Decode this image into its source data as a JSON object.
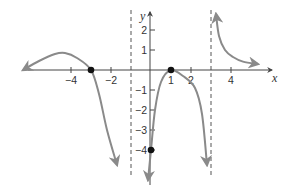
{
  "chart_data": {
    "type": "line",
    "title": "",
    "xlabel": "x",
    "ylabel": "y",
    "xlim": [
      -6.4,
      6.2
    ],
    "ylim": [
      -5.6,
      3.0
    ],
    "grid": false,
    "legend": null,
    "x_ticks": [
      -4,
      -2,
      1,
      2,
      4
    ],
    "x_tick_labels": [
      "−4",
      "−2",
      "1",
      "2",
      "4"
    ],
    "y_ticks": [
      2,
      1,
      -1,
      -2,
      -3,
      -4
    ],
    "y_tick_labels": [
      "2",
      "1",
      "−1",
      "−2",
      "−3",
      "−4"
    ],
    "vertical_asymptotes": [
      -1,
      3
    ],
    "marked_points": [
      {
        "x": -3,
        "y": 0,
        "label": "x-intercept"
      },
      {
        "x": 1,
        "y": 0,
        "label": "x-intercept"
      },
      {
        "x": 0,
        "y": -4,
        "label": "y-intercept"
      }
    ],
    "series": [
      {
        "name": "left-branch",
        "points": [
          [
            -6.4,
            0.0
          ],
          [
            -5.6,
            0.45
          ],
          [
            -4.8,
            0.8
          ],
          [
            -4.3,
            0.85
          ],
          [
            -3.7,
            0.6
          ],
          [
            -3.0,
            0.0
          ],
          [
            -2.6,
            -1.2
          ],
          [
            -2.2,
            -3.0
          ],
          [
            -1.7,
            -4.75
          ]
        ],
        "arrow_start": true,
        "arrow_end": true
      },
      {
        "name": "middle-branch",
        "points": [
          [
            -0.15,
            -5.5
          ],
          [
            0.0,
            -4.0
          ],
          [
            0.2,
            -2.0
          ],
          [
            0.5,
            -0.6
          ],
          [
            1.0,
            0.0
          ],
          [
            1.6,
            -0.3
          ],
          [
            2.2,
            -0.9
          ],
          [
            2.55,
            -2.2
          ],
          [
            2.8,
            -4.75
          ]
        ],
        "arrow_start": true,
        "arrow_end": true
      },
      {
        "name": "right-branch",
        "points": [
          [
            3.25,
            2.8
          ],
          [
            3.4,
            1.7
          ],
          [
            3.7,
            1.0
          ],
          [
            4.1,
            0.65
          ],
          [
            4.6,
            0.42
          ],
          [
            5.35,
            0.3
          ]
        ],
        "arrow_start": true,
        "arrow_end": true
      }
    ]
  },
  "style": {
    "curve_color": "#8a8a8a",
    "axis_color": "#444444",
    "asymptote_color": "#555555",
    "point_color": "#111111"
  }
}
